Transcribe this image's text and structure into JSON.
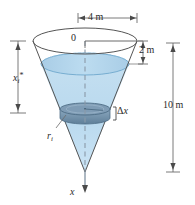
{
  "figure": {
    "background_color": "#ffffff",
    "labels": {
      "top_diameter": "4 m",
      "origin": "0",
      "surface_depth": "2 m",
      "cone_height": "10 m",
      "slab_thickness_delta": "Δ",
      "slab_thickness_var": "x",
      "depth_var": "x",
      "depth_sub": "i",
      "depth_sup": "*",
      "radius_var": "r",
      "radius_sub": "i",
      "axis": "x"
    },
    "colors": {
      "outline": "#555555",
      "water_fill": "#b9d9ee",
      "water_fill_light": "#cfe5f4",
      "water_surface": "#9ecae4",
      "water_edge": "#6fa8cd",
      "slab_fill": "#7f9cb5",
      "slab_dark": "#5d7d97",
      "dim_line": "#6b6b6b",
      "axis_line": "#8a9aa8",
      "text": "#2b2b2b"
    },
    "geometry": {
      "cone_top_center_x": 85,
      "cone_top_y": 41,
      "cone_top_rx": 52,
      "cone_top_ry": 13,
      "cone_apex_y": 172,
      "water_level_y": 64,
      "water_rx": 44,
      "water_ry": 11,
      "slab_center_y": 113,
      "slab_rx": 25,
      "slab_ry": 6,
      "slab_height": 9,
      "dim_4m_x1": 78,
      "dim_4m_x2": 137,
      "dim_4m_y": 18,
      "dim_2m_x": 143,
      "dim_2m_y1": 41,
      "dim_2m_y2": 64,
      "dim_10m_x": 173,
      "dim_10m_y1": 43,
      "dim_10m_y2": 172,
      "dim_xi_x": 18,
      "dim_xi_y1": 41,
      "dim_xi_y2": 113
    },
    "annotations": {
      "dashed_axis": true,
      "axis_arrow_tip_y": 193,
      "leader_from_ri_to_slab": true,
      "bracket_for_delta_x": true
    }
  }
}
